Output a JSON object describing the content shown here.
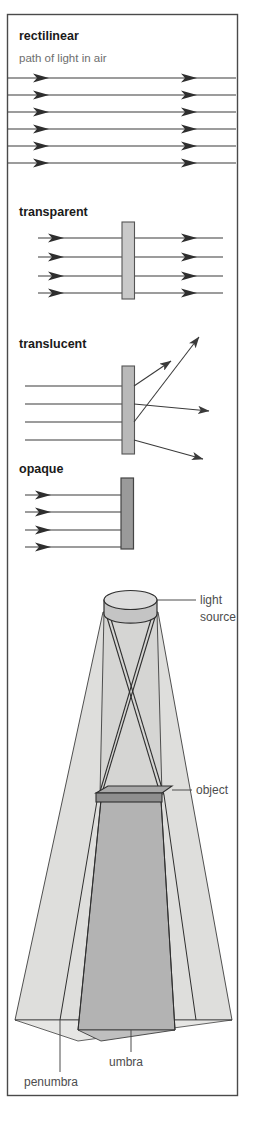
{
  "figure": {
    "frame_color": "#4a4a4a",
    "background": "#ffffff"
  },
  "panels": [
    {
      "id": "rectilinear",
      "title": "rectilinear",
      "subtitle": "path of light in air",
      "ray_count": 6,
      "ray_color": "#3a3a3a",
      "description": "straight parallel light rays in air"
    },
    {
      "id": "transparent",
      "title": "transparent",
      "ray_count": 4,
      "slab_color": "#c9c9c9",
      "slab_border": "#555555",
      "description": "rays pass straight through the slab"
    },
    {
      "id": "translucent",
      "title": "translucent",
      "ray_count": 4,
      "slab_color": "#b9b9b9",
      "slab_border": "#555555",
      "description": "rays are scattered into diverging directions"
    },
    {
      "id": "opaque",
      "title": "opaque",
      "ray_count": 4,
      "slab_color": "#9a9a9a",
      "slab_border": "#444444",
      "description": "rays are blocked by the slab"
    }
  ],
  "shadow_diagram": {
    "labels": {
      "light_source_line1": "light",
      "light_source_line2": "source",
      "object": "object",
      "umbra": "umbra",
      "penumbra": "penumbra"
    },
    "colors": {
      "source_top": "#dcdcdc",
      "source_body": "#c4c4c4",
      "penumbra_fill": "#dededc",
      "umbra_fill": "#b3b3b3",
      "object_fill": "#8f8f8f",
      "outline": "#3d3d3d"
    }
  }
}
